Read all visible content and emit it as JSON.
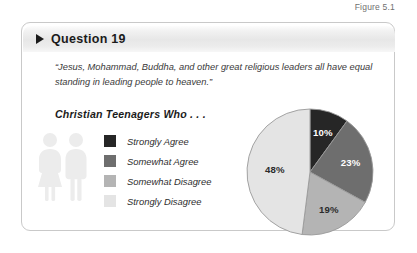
{
  "figure": {
    "caption": "Figure 5.1"
  },
  "card": {
    "header": {
      "title": "Question 19",
      "bullet_icon": "triangle-right-icon"
    },
    "quote": "“Jesus, Mohammad, Buddha, and other great religious leaders all have equal standing in leading people to heaven.”",
    "subheading": "Christian Teenagers Who . . ."
  },
  "people_icon": {
    "name": "two-people-icon",
    "color": "#ececec"
  },
  "legend": {
    "items": [
      {
        "label": "Strongly Agree",
        "color": "#262626"
      },
      {
        "label": "Somewhat Agree",
        "color": "#6e6e6e"
      },
      {
        "label": "Somewhat Disagree",
        "color": "#b4b4b4"
      },
      {
        "label": "Strongly Disagree",
        "color": "#e4e4e4"
      }
    ]
  },
  "chart_data": {
    "type": "pie",
    "title": "Christian Teenagers Who . . .",
    "categories": [
      "Strongly Agree",
      "Somewhat Agree",
      "Somewhat Disagree",
      "Strongly Disagree"
    ],
    "values": [
      10,
      23,
      19,
      48
    ],
    "value_labels": [
      "10%",
      "23%",
      "19%",
      "48%"
    ],
    "colors": [
      "#262626",
      "#6e6e6e",
      "#b4b4b4",
      "#e4e4e4"
    ],
    "label_colors": [
      "#ffffff",
      "#ffffff",
      "#2b2b2b",
      "#2b2b2b"
    ],
    "unit": "%",
    "start_angle_deg": 0,
    "direction": "clockwise",
    "legend_position": "left",
    "grid": false
  }
}
